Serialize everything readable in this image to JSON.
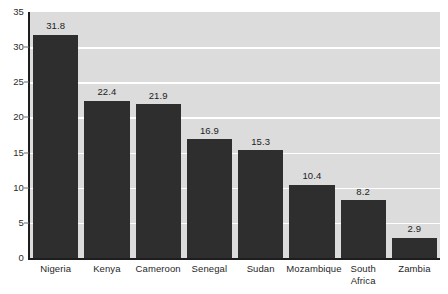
{
  "chart_data": {
    "type": "bar",
    "title": "",
    "xlabel": "",
    "ylabel": "",
    "ylim": [
      0,
      35
    ],
    "yticks": [
      0,
      5,
      10,
      15,
      20,
      25,
      30,
      35
    ],
    "grid": "horizontal-white",
    "legend": "none",
    "categories": [
      "Nigeria",
      "Kenya",
      "Cameroon",
      "Senegal",
      "Sudan",
      "Mozambique",
      "South Africa",
      "Zambia"
    ],
    "values": [
      31.8,
      22.4,
      21.9,
      16.9,
      15.3,
      10.4,
      8.2,
      2.9
    ],
    "value_labels": [
      "31.8",
      "22.4",
      "21.9",
      "16.9",
      "15.3",
      "10.4",
      "8.2",
      "2.9"
    ],
    "category_label_lines": [
      [
        "Nigeria"
      ],
      [
        "Kenya"
      ],
      [
        "Cameroon"
      ],
      [
        "Senegal"
      ],
      [
        "Sudan"
      ],
      [
        "Mozambique"
      ],
      [
        "South",
        "Africa"
      ],
      [
        "Zambia"
      ]
    ],
    "colors": {
      "bar": "#2e2e2e",
      "plot_background": "#dcdcdc",
      "gridline": "#ffffff",
      "axis": "#1d1d1d",
      "text": "#222222",
      "page_background": "#ffffff"
    }
  },
  "axis": {
    "y_tick_labels": [
      "35",
      "30",
      "25",
      "20",
      "15",
      "10",
      "5",
      "0"
    ]
  }
}
